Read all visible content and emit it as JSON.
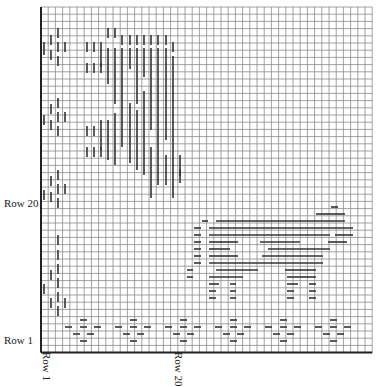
{
  "chart_data": {
    "type": "table",
    "title": "",
    "grid": {
      "x0": 41,
      "y0": 7,
      "cols": 46,
      "rows": 48,
      "cell": 7.2,
      "color": "#8a8a8a",
      "major_color": "#222222"
    },
    "labels": {
      "row_1_left": "Row 1",
      "row_20_left": "Row 20",
      "row_1_bottom": "Row 1",
      "row_20_bottom": "Row 20"
    },
    "stitch_color": "#333333",
    "vertical_stitches": [
      [
        44,
        42,
        55
      ],
      [
        44,
        115,
        125
      ],
      [
        44,
        190,
        200
      ],
      [
        44,
        284,
        294
      ],
      [
        51,
        35,
        45
      ],
      [
        51,
        104,
        114
      ],
      [
        51,
        176,
        186
      ],
      [
        51,
        270,
        280
      ],
      [
        51,
        50,
        60
      ],
      [
        51,
        120,
        130
      ],
      [
        51,
        192,
        202
      ],
      [
        51,
        298,
        308
      ],
      [
        58,
        28,
        38
      ],
      [
        58,
        42,
        52
      ],
      [
        58,
        56,
        66
      ],
      [
        58,
        98,
        108
      ],
      [
        58,
        112,
        122
      ],
      [
        58,
        126,
        136
      ],
      [
        58,
        170,
        180
      ],
      [
        58,
        184,
        194
      ],
      [
        58,
        198,
        208
      ],
      [
        58,
        235,
        245
      ],
      [
        58,
        250,
        260
      ],
      [
        58,
        264,
        274
      ],
      [
        58,
        278,
        288
      ],
      [
        58,
        292,
        302
      ],
      [
        58,
        306,
        316
      ],
      [
        65,
        42,
        52
      ],
      [
        65,
        112,
        122
      ],
      [
        65,
        184,
        194
      ],
      [
        65,
        298,
        308
      ],
      [
        87,
        42,
        52
      ],
      [
        87,
        63,
        73
      ],
      [
        87,
        126,
        136
      ],
      [
        87,
        147,
        157
      ],
      [
        94,
        42,
        52
      ],
      [
        94,
        63,
        73
      ],
      [
        94,
        126,
        136
      ],
      [
        94,
        147,
        157
      ],
      [
        101,
        42,
        67
      ],
      [
        101,
        63,
        73
      ],
      [
        101,
        120,
        150
      ],
      [
        101,
        147,
        157
      ],
      [
        108,
        28,
        38
      ],
      [
        108,
        48,
        84
      ],
      [
        108,
        120,
        160
      ],
      [
        115,
        28,
        38
      ],
      [
        115,
        48,
        104
      ],
      [
        115,
        113,
        165
      ],
      [
        122,
        35,
        45
      ],
      [
        122,
        48,
        147
      ],
      [
        130,
        35,
        45
      ],
      [
        130,
        48,
        69
      ],
      [
        130,
        103,
        163
      ],
      [
        137,
        35,
        45
      ],
      [
        137,
        48,
        104
      ],
      [
        137,
        110,
        170
      ],
      [
        144,
        35,
        45
      ],
      [
        144,
        48,
        77
      ],
      [
        144,
        91,
        175
      ],
      [
        151,
        35,
        45
      ],
      [
        151,
        48,
        130
      ],
      [
        151,
        147,
        198
      ],
      [
        158,
        35,
        45
      ],
      [
        158,
        48,
        185
      ],
      [
        166,
        35,
        45
      ],
      [
        166,
        48,
        140
      ],
      [
        166,
        155,
        185
      ],
      [
        173,
        42,
        52
      ],
      [
        173,
        56,
        198
      ],
      [
        180,
        155,
        183
      ],
      [
        180,
        169,
        176
      ]
    ],
    "horizontal_stitches": [
      [
        207,
        331,
        338
      ],
      [
        214,
        316,
        345
      ],
      [
        221,
        202,
        208
      ],
      [
        221,
        216,
        345
      ],
      [
        228,
        194,
        201
      ],
      [
        228,
        209,
        353
      ],
      [
        235,
        194,
        201
      ],
      [
        235,
        209,
        330
      ],
      [
        235,
        335,
        353
      ],
      [
        242,
        194,
        201
      ],
      [
        242,
        209,
        238
      ],
      [
        242,
        260,
        300
      ],
      [
        242,
        328,
        347
      ],
      [
        249,
        194,
        201
      ],
      [
        249,
        209,
        230
      ],
      [
        249,
        268,
        330
      ],
      [
        256,
        194,
        201
      ],
      [
        256,
        209,
        238
      ],
      [
        256,
        262,
        323
      ],
      [
        263,
        194,
        201
      ],
      [
        263,
        209,
        323
      ],
      [
        270,
        187,
        193
      ],
      [
        270,
        216,
        258
      ],
      [
        270,
        285,
        316
      ],
      [
        277,
        187,
        193
      ],
      [
        277,
        209,
        243
      ],
      [
        277,
        287,
        316
      ],
      [
        284,
        209,
        219
      ],
      [
        284,
        230,
        236
      ],
      [
        284,
        287,
        298
      ],
      [
        284,
        309,
        316
      ],
      [
        291,
        209,
        216
      ],
      [
        291,
        230,
        236
      ],
      [
        291,
        287,
        294
      ],
      [
        291,
        309,
        316
      ],
      [
        298,
        209,
        216
      ],
      [
        298,
        230,
        236
      ],
      [
        298,
        287,
        294
      ],
      [
        298,
        309,
        316
      ],
      [
        320,
        80,
        87
      ],
      [
        320,
        130,
        137
      ],
      [
        320,
        180,
        187
      ],
      [
        320,
        230,
        237
      ],
      [
        320,
        280,
        287
      ],
      [
        320,
        330,
        337
      ],
      [
        327,
        65,
        72
      ],
      [
        327,
        80,
        87
      ],
      [
        327,
        94,
        101
      ],
      [
        327,
        115,
        122
      ],
      [
        327,
        130,
        137
      ],
      [
        327,
        144,
        151
      ],
      [
        327,
        165,
        172
      ],
      [
        327,
        180,
        187
      ],
      [
        327,
        194,
        201
      ],
      [
        327,
        215,
        222
      ],
      [
        327,
        230,
        237
      ],
      [
        327,
        244,
        251
      ],
      [
        327,
        265,
        272
      ],
      [
        327,
        280,
        287
      ],
      [
        327,
        294,
        301
      ],
      [
        327,
        315,
        322
      ],
      [
        327,
        330,
        337
      ],
      [
        327,
        344,
        351
      ],
      [
        334,
        73,
        80
      ],
      [
        334,
        87,
        94
      ],
      [
        334,
        123,
        130
      ],
      [
        334,
        137,
        144
      ],
      [
        334,
        173,
        180
      ],
      [
        334,
        187,
        194
      ],
      [
        334,
        223,
        230
      ],
      [
        334,
        237,
        244
      ],
      [
        334,
        273,
        280
      ],
      [
        334,
        287,
        294
      ],
      [
        334,
        323,
        330
      ],
      [
        334,
        337,
        344
      ],
      [
        341,
        80,
        87
      ],
      [
        341,
        130,
        137
      ],
      [
        341,
        180,
        187
      ],
      [
        341,
        230,
        237
      ],
      [
        341,
        280,
        287
      ],
      [
        341,
        330,
        337
      ]
    ]
  }
}
